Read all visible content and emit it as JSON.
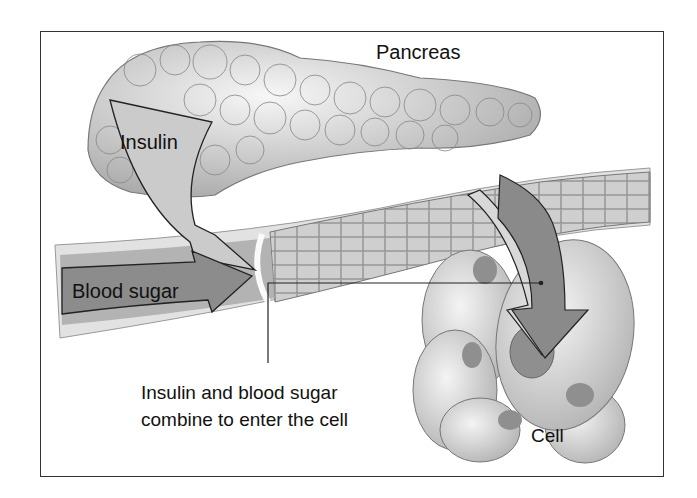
{
  "diagram": {
    "labels": {
      "pancreas": "Pancreas",
      "insulin": "Insulin",
      "blood_sugar": "Blood sugar",
      "combine_line1": "Insulin and blood sugar",
      "combine_line2": "combine to enter the cell",
      "cell": "Cell"
    },
    "colors": {
      "frame": "#333333",
      "organ_light": "#e6e6e6",
      "organ_mid": "#bdbdbd",
      "arrow_light": "#c8c8c8",
      "arrow_dark": "#8a8a8a",
      "vessel": "#c4c4c4",
      "vessel_inner": "#9a9a9a"
    }
  }
}
